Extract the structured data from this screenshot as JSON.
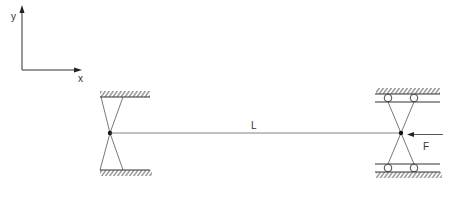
{
  "diagram": {
    "type": "structural-mechanics-schematic",
    "axes": {
      "y_label": "y",
      "x_label": "x"
    },
    "beam": {
      "length_label": "L"
    },
    "load": {
      "label": "F",
      "direction": "leftward-compressive"
    },
    "left_support": {
      "kind": "pinned-hinge-between-fixed-walls"
    },
    "right_support": {
      "kind": "pinned-hinge-on-rollers"
    },
    "colors": {
      "stroke": "#333333",
      "background": "#ffffff"
    }
  }
}
